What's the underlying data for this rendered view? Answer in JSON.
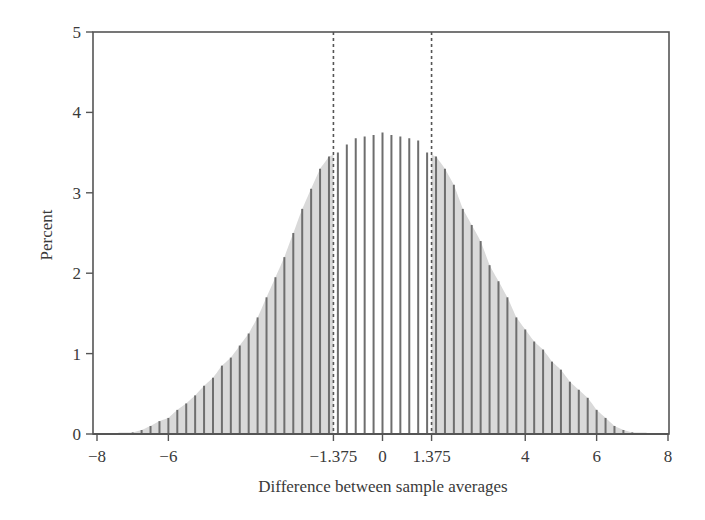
{
  "chart_data": {
    "type": "bar",
    "title": "",
    "xlabel": "Difference between sample averages",
    "ylabel": "Percent",
    "xlim": [
      -8,
      8
    ],
    "ylim": [
      0,
      5
    ],
    "xticks": [
      -8,
      -6,
      -1.375,
      0,
      1.375,
      4,
      6,
      8
    ],
    "xtick_labels": [
      "−8",
      "−6",
      "−1.375",
      "0",
      "1.375",
      "4",
      "6",
      "8"
    ],
    "yticks": [
      0,
      1,
      2,
      3,
      4,
      5
    ],
    "ytick_labels": [
      "0",
      "1",
      "2",
      "3",
      "4",
      "5"
    ],
    "grid": false,
    "legend": null,
    "reference_lines": [
      {
        "x": -1.375,
        "style": "dashed"
      },
      {
        "x": 1.375,
        "style": "dashed"
      }
    ],
    "shaded_region": "tails beyond |x| > 1.375 shaded light gray",
    "x": [
      -7.0,
      -6.75,
      -6.5,
      -6.25,
      -6.0,
      -5.75,
      -5.5,
      -5.25,
      -5.0,
      -4.75,
      -4.5,
      -4.25,
      -4.0,
      -3.75,
      -3.5,
      -3.25,
      -3.0,
      -2.75,
      -2.5,
      -2.25,
      -2.0,
      -1.75,
      -1.5,
      -1.25,
      -1.0,
      -0.75,
      -0.5,
      -0.25,
      0.0,
      0.25,
      0.5,
      0.75,
      1.0,
      1.25,
      1.5,
      1.75,
      2.0,
      2.25,
      2.5,
      2.75,
      3.0,
      3.25,
      3.5,
      3.75,
      4.0,
      4.25,
      4.5,
      4.75,
      5.0,
      5.25,
      5.5,
      5.75,
      6.0,
      6.25,
      6.5,
      6.75,
      7.0
    ],
    "values": [
      0.02,
      0.05,
      0.1,
      0.16,
      0.2,
      0.3,
      0.38,
      0.48,
      0.6,
      0.7,
      0.85,
      0.95,
      1.1,
      1.25,
      1.45,
      1.7,
      1.95,
      2.2,
      2.5,
      2.8,
      3.05,
      3.3,
      3.45,
      3.5,
      3.6,
      3.68,
      3.7,
      3.72,
      3.75,
      3.72,
      3.7,
      3.68,
      3.65,
      3.5,
      3.45,
      3.3,
      3.1,
      2.8,
      2.6,
      2.4,
      2.1,
      1.9,
      1.7,
      1.45,
      1.3,
      1.15,
      1.05,
      0.9,
      0.8,
      0.65,
      0.55,
      0.45,
      0.3,
      0.2,
      0.1,
      0.05,
      0.02
    ]
  },
  "axes": {
    "xlabel": "Difference between sample averages",
    "ylabel": "Percent"
  },
  "colors": {
    "bar": "#6e6e6e",
    "fill": "#d9d9d9",
    "axis": "#555555",
    "dashed": "#555555"
  }
}
